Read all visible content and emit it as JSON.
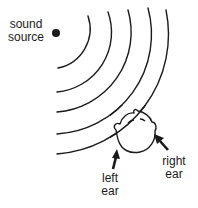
{
  "diagram": {
    "labels": {
      "sound_source": [
        "sound",
        "source"
      ],
      "left_ear": [
        "left",
        "ear"
      ],
      "right_ear": [
        "right",
        "ear"
      ]
    },
    "elements": {
      "source_dot": "filled circle marking the sound source",
      "wavefronts": 5,
      "head": "top-down view of a head",
      "arrows": [
        "left-ear-arrow",
        "right-ear-arrow"
      ]
    },
    "colors": {
      "stroke": "#1a1a1a",
      "background": "#ffffff"
    }
  }
}
